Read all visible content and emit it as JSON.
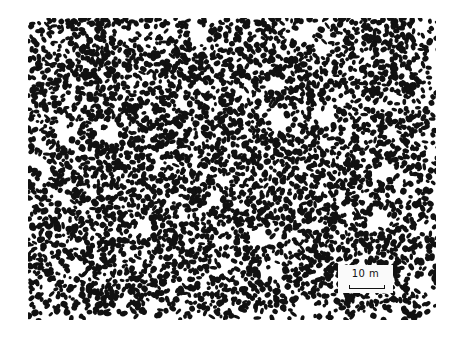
{
  "figure": {
    "colors": {
      "background": "#ffffff",
      "speckle": "#111111"
    },
    "image_bounds": {
      "x": 28,
      "y": 18,
      "width": 408,
      "height": 302
    },
    "white_patches": [
      {
        "x": 170,
        "y": 15,
        "r": 11
      },
      {
        "x": 274,
        "y": 17,
        "r": 10
      },
      {
        "x": 37,
        "y": 117,
        "r": 9
      },
      {
        "x": 80,
        "y": 117,
        "r": 10
      },
      {
        "x": 7,
        "y": 142,
        "r": 8
      },
      {
        "x": 252,
        "y": 102,
        "r": 11
      },
      {
        "x": 297,
        "y": 100,
        "r": 10
      },
      {
        "x": 359,
        "y": 154,
        "r": 10
      },
      {
        "x": 350,
        "y": 202,
        "r": 11
      },
      {
        "x": 117,
        "y": 210,
        "r": 10
      },
      {
        "x": 187,
        "y": 180,
        "r": 8
      },
      {
        "x": 230,
        "y": 220,
        "r": 9
      },
      {
        "x": 197,
        "y": 247,
        "r": 8
      },
      {
        "x": 247,
        "y": 252,
        "r": 9
      },
      {
        "x": 277,
        "y": 287,
        "r": 10
      },
      {
        "x": 155,
        "y": 85,
        "r": 7
      },
      {
        "x": 120,
        "y": 60,
        "r": 6
      },
      {
        "x": 340,
        "y": 40,
        "r": 7
      },
      {
        "x": 50,
        "y": 250,
        "r": 7
      },
      {
        "x": 395,
        "y": 265,
        "r": 9
      }
    ]
  },
  "scale_bar": {
    "label": "10 m"
  }
}
